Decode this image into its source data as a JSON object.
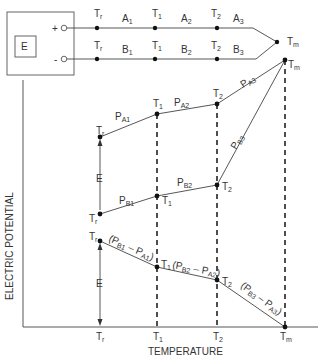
{
  "circuit": {
    "source_label": "E",
    "plus_terminal": "+",
    "minus_terminal": "-",
    "wire_a": {
      "nodes": [
        "Tr",
        "T1",
        "T2"
      ],
      "segments": [
        "A1",
        "A2",
        "A3"
      ]
    },
    "wire_b": {
      "nodes": [
        "Tr",
        "T1",
        "T2"
      ],
      "segments": [
        "B1",
        "B2",
        "B3"
      ]
    },
    "junction_label": "Tm"
  },
  "graph": {
    "x_axis_label": "TEMPERATURE",
    "y_axis_label": "ELECTRIC POTENTIAL",
    "x_ticks": [
      "Tr",
      "T1",
      "T2",
      "Tm"
    ],
    "curve_a": {
      "points": [
        "Tr",
        "T1",
        "T2",
        "Tm"
      ],
      "segment_labels": [
        "PA1",
        "PA2",
        "PA3"
      ]
    },
    "curve_b": {
      "points": [
        "Tr",
        "T1",
        "T2",
        "Tm"
      ],
      "segment_labels": [
        "PB1",
        "PB2",
        "PB3"
      ]
    },
    "difference_curve": {
      "points": [
        "Tr",
        "T1",
        "T2",
        "Tm"
      ],
      "segment_labels": [
        "(PB1 – PA1)",
        "(PB2 – PA2)",
        "(PB3 – PA3)"
      ]
    },
    "emf_label_upper": "E",
    "emf_label_lower": "E"
  }
}
